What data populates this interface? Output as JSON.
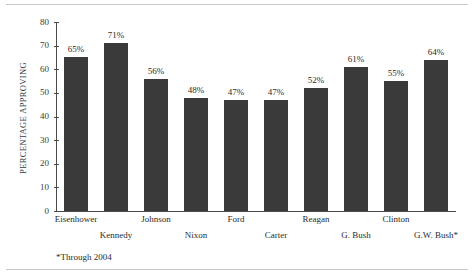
{
  "chart_data": {
    "type": "bar",
    "title": "",
    "subtitle": "",
    "xlabel": "",
    "ylabel": "PERCENTAGE APPROVING",
    "ylim": [
      0,
      80
    ],
    "yticks": [
      0,
      10,
      20,
      30,
      40,
      50,
      60,
      70,
      80
    ],
    "ytick_labels": [
      "0",
      "10",
      "20",
      "30",
      "40",
      "50",
      "60",
      "70",
      "80"
    ],
    "grid": false,
    "legend": null,
    "legend_position": "none",
    "bar_color": "#3a3a3a",
    "axis_color": "#4a4a4a",
    "categories": [
      "Eisenhower",
      "Kennedy",
      "Johnson",
      "Nixon",
      "Ford",
      "Carter",
      "Reagan",
      "G. Bush",
      "Clinton",
      "G.W. Bush*"
    ],
    "values": [
      65,
      71,
      56,
      48,
      47,
      47,
      52,
      61,
      55,
      64
    ],
    "value_labels": [
      "65%",
      "71%",
      "56%",
      "48%",
      "47%",
      "47%",
      "52%",
      "61%",
      "55%",
      "64%"
    ],
    "category_label_rows": [
      0,
      1,
      0,
      1,
      0,
      1,
      0,
      1,
      0,
      1
    ],
    "annotations": [
      "*Through 2004"
    ]
  },
  "footnote": "*Through 2004"
}
